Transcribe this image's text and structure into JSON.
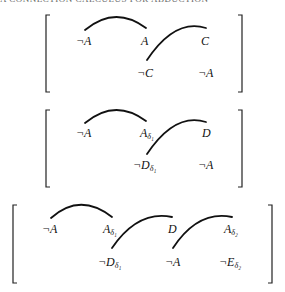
{
  "header_fragment": "A CONNECTION CALCULUS FOR ABDUCTION",
  "matrices": [
    {
      "row1": [
        {
          "lit": "¬A",
          "sub": ""
        },
        {
          "lit": "A",
          "sub": ""
        },
        {
          "lit": "C",
          "sub": ""
        }
      ],
      "row2": [
        {
          "lit": "¬C",
          "sub": ""
        },
        {
          "lit": "¬A",
          "sub": ""
        }
      ]
    },
    {
      "row1": [
        {
          "lit": "¬A",
          "sub": ""
        },
        {
          "lit": "A",
          "sub": "δ₁"
        },
        {
          "lit": "D",
          "sub": ""
        }
      ],
      "row2": [
        {
          "lit": "¬D",
          "sub": "δ₁"
        },
        {
          "lit": "¬A",
          "sub": ""
        }
      ]
    },
    {
      "row1": [
        {
          "lit": "¬A",
          "sub": ""
        },
        {
          "lit": "A",
          "sub": "δ₁"
        },
        {
          "lit": "D",
          "sub": ""
        },
        {
          "lit": "A",
          "sub": "δ₂"
        }
      ],
      "row2": [
        {
          "lit": "¬D",
          "sub": "δ₁"
        },
        {
          "lit": "¬A",
          "sub": ""
        },
        {
          "lit": "¬E",
          "sub": "δ₂"
        }
      ]
    }
  ],
  "colors": {
    "ink": "#111111",
    "background": "#ffffff"
  }
}
